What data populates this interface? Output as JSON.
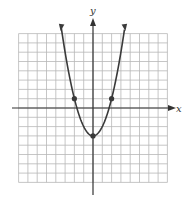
{
  "chart_data": {
    "type": "line",
    "title": "",
    "xlabel": "x",
    "ylabel": "y",
    "xlim": [
      -8,
      8
    ],
    "ylim": [
      -8,
      8
    ],
    "grid": true,
    "function": "y = x^2 - 3",
    "series": [
      {
        "name": "parabola",
        "x": [
          -3.3,
          -3,
          -2,
          -1,
          0,
          1,
          2,
          3,
          3.3
        ],
        "values": [
          7.9,
          6,
          1,
          -2,
          -3,
          -2,
          1,
          6,
          7.9
        ]
      }
    ],
    "marked_points": [
      {
        "x": -2,
        "y": 1
      },
      {
        "x": 0,
        "y": -3
      },
      {
        "x": 2,
        "y": 1
      }
    ]
  },
  "labels": {
    "x_axis": "x",
    "y_axis": "y"
  },
  "colors": {
    "grid": "#b8b8b8",
    "axis": "#333333",
    "curve": "#3a3a3a",
    "point": "#3a3a3a"
  }
}
